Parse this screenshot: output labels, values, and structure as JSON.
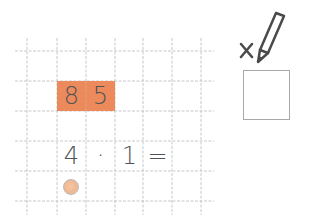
{
  "worksheet": {
    "grid": {
      "vertical_lines_x": [
        27,
        57,
        86,
        115,
        143,
        172,
        201
      ],
      "horizontal_lines_y": [
        51,
        81,
        111,
        141,
        171,
        201
      ],
      "line_color": "#c4c8cc"
    },
    "highlight": {
      "color": "#ec8a5c",
      "digits": [
        "8",
        "5"
      ]
    },
    "expression": {
      "left": "4",
      "operator": "·",
      "right": "1",
      "equals": "="
    },
    "marker_circle_color": "#f0b690",
    "answer_area": {
      "icon": "x-pencil-icon",
      "box": ""
    }
  }
}
